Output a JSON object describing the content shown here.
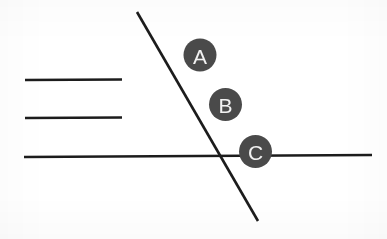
{
  "canvas": {
    "width": 387,
    "height": 239,
    "background_color": "#ffffff"
  },
  "style": {
    "line_color": "#1c1c1c",
    "line_width": 2.6,
    "marker_fill_color": "#4a4a4a",
    "marker_label_color": "#f2f2f2",
    "marker_radius": 16.5
  },
  "chart_data": {
    "type": "diagram",
    "title": "",
    "lines": [
      {
        "id": "short-line-1",
        "name": "upper-short-horizontal-line",
        "orientation": "horizontal",
        "x1": 25,
        "y1": 80,
        "x2": 122,
        "y2": 79.5,
        "length": 97
      },
      {
        "id": "short-line-2",
        "name": "lower-short-horizontal-line",
        "orientation": "horizontal",
        "x1": 25,
        "y1": 118,
        "x2": 122,
        "y2": 117.5,
        "length": 97
      },
      {
        "id": "long-line",
        "name": "main-horizontal-line",
        "orientation": "horizontal",
        "x1": 24,
        "y1": 157,
        "x2": 372,
        "y2": 155,
        "length": 348
      },
      {
        "id": "diagonal-line",
        "name": "transversal-diagonal-line",
        "orientation": "diagonal",
        "x1": 137,
        "y1": 12,
        "x2": 258,
        "y2": 221,
        "slope": 1.727
      }
    ],
    "intersections": [
      {
        "name": "diagonal-crosses-main-horizontal",
        "x": 215,
        "y": 156
      }
    ],
    "markers": [
      {
        "id": "marker-a",
        "label": "A",
        "cx": 200,
        "cy": 55,
        "r": 16.5
      },
      {
        "id": "marker-b",
        "label": "B",
        "cx": 225.5,
        "cy": 104.5,
        "r": 16.5
      },
      {
        "id": "marker-c",
        "label": "C",
        "cx": 255.5,
        "cy": 151.5,
        "r": 16.5
      }
    ]
  }
}
